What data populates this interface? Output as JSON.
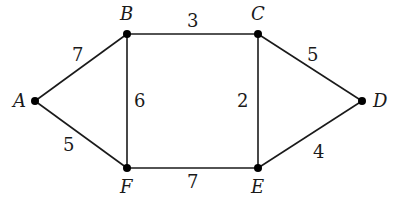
{
  "graph": {
    "nodes": [
      {
        "id": "A",
        "label": "A",
        "x": 35,
        "y": 101,
        "lx": 13,
        "ly": 107
      },
      {
        "id": "B",
        "label": "B",
        "x": 127,
        "y": 34,
        "lx": 120,
        "ly": 20
      },
      {
        "id": "C",
        "label": "C",
        "x": 258,
        "y": 34,
        "lx": 251,
        "ly": 20
      },
      {
        "id": "D",
        "label": "D",
        "x": 362,
        "y": 101,
        "lx": 373,
        "ly": 107
      },
      {
        "id": "E",
        "label": "E",
        "x": 258,
        "y": 168,
        "lx": 251,
        "ly": 193
      },
      {
        "id": "F",
        "label": "F",
        "x": 127,
        "y": 168,
        "lx": 120,
        "ly": 193
      }
    ],
    "edges": [
      {
        "from": "A",
        "to": "B",
        "weight": "7",
        "lx": 72,
        "ly": 61
      },
      {
        "from": "B",
        "to": "C",
        "weight": "3",
        "lx": 187,
        "ly": 27
      },
      {
        "from": "C",
        "to": "D",
        "weight": "5",
        "lx": 307,
        "ly": 61
      },
      {
        "from": "B",
        "to": "F",
        "weight": "6",
        "lx": 134,
        "ly": 107
      },
      {
        "from": "C",
        "to": "E",
        "weight": "2",
        "lx": 237,
        "ly": 107
      },
      {
        "from": "A",
        "to": "F",
        "weight": "5",
        "lx": 63,
        "ly": 151
      },
      {
        "from": "F",
        "to": "E",
        "weight": "7",
        "lx": 187,
        "ly": 188
      },
      {
        "from": "E",
        "to": "D",
        "weight": "4",
        "lx": 313,
        "ly": 158
      }
    ]
  }
}
